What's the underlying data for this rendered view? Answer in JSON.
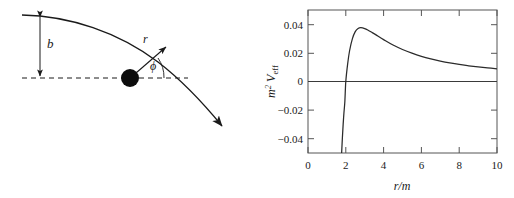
{
  "figure": {
    "panels": [
      "scattering-diagram",
      "effective-potential-plot"
    ]
  },
  "diagram": {
    "name": "photon-scattering-diagram",
    "labels": {
      "impact_parameter": "b",
      "radius": "r",
      "angle": "ϕ"
    },
    "elements": {
      "mass_point": "black-filled-circle",
      "trajectory": "curved-arrow-trajectory",
      "axis_line": "dashed-horizontal-axis",
      "impact_arrow": "double-headed-vertical-arrow"
    }
  },
  "chart_data": {
    "type": "line",
    "title": "",
    "xlabel": "r/m",
    "ylabel": "m^2 V_eff",
    "ylabel_parts": {
      "base": "m",
      "exponent": "2",
      "symbol": "V",
      "subscript": "eff"
    },
    "xlim": [
      0,
      10
    ],
    "ylim": [
      -0.05,
      0.05
    ],
    "xticks": [
      0,
      2,
      4,
      6,
      8,
      10
    ],
    "xticklabels": [
      "0",
      "2",
      "4",
      "6",
      "8",
      "10"
    ],
    "yticks": [
      0.04,
      0.02,
      0,
      -0.02,
      -0.04
    ],
    "yticklabels": [
      "0.04",
      "0.02",
      "0",
      "−0.02",
      "−0.04"
    ],
    "grid": false,
    "legend": false,
    "series": [
      {
        "name": "zero-line",
        "style": "horizontal-reference-line",
        "x": [
          0,
          10
        ],
        "values": [
          0,
          0
        ]
      },
      {
        "name": "effective-potential",
        "style": "solid-curve",
        "x": [
          1.78,
          1.82,
          1.86,
          1.9,
          1.95,
          2.0,
          2.1,
          2.2,
          2.35,
          2.5,
          2.65,
          2.8,
          3.0,
          3.2,
          3.4,
          3.6,
          3.8,
          4.0,
          4.5,
          5.0,
          5.5,
          6.0,
          6.5,
          7.0,
          7.5,
          8.0,
          8.5,
          9.0,
          9.5,
          10.0
        ],
        "values": [
          -0.05,
          -0.0392,
          -0.03,
          -0.0222,
          -0.014,
          -0.0,
          0.0125,
          0.0215,
          0.03,
          0.0349,
          0.0371,
          0.0376,
          0.037,
          0.0357,
          0.0342,
          0.0326,
          0.0309,
          0.0293,
          0.0255,
          0.0224,
          0.0198,
          0.0176,
          0.0158,
          0.0143,
          0.013,
          0.0119,
          0.011,
          0.0102,
          0.0095,
          0.0089
        ]
      }
    ],
    "annotations": {
      "peak_x": 2.9,
      "peak_y": 0.0376,
      "zero_crossing_x": 2.0
    }
  },
  "colors": {
    "ink": "#1a1a1a",
    "axis": "#4a4a4a",
    "curve": "#2b2b2b",
    "background": "#ffffff"
  }
}
